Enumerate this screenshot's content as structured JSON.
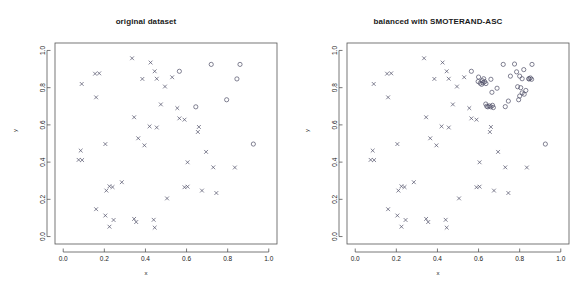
{
  "figure": {
    "background": "#ffffff",
    "axis_color": "#555555",
    "marker_color": "#4d4d66",
    "width": 584,
    "height": 292
  },
  "panels": [
    {
      "id": "original",
      "title": "original dataset",
      "xlabel": "x",
      "ylabel": "y"
    },
    {
      "id": "balanced",
      "title": "balanced with SMOTERAND-ASC",
      "xlabel": "x",
      "ylabel": "y"
    }
  ],
  "chart_data": [
    {
      "type": "scatter",
      "title": "original dataset",
      "xlabel": "x",
      "ylabel": "y",
      "xlim": [
        -0.04,
        1.04
      ],
      "ylim": [
        -0.04,
        1.04
      ],
      "xticks": [
        "0.0",
        "0.2",
        "0.4",
        "0.6",
        "0.8",
        "1.0"
      ],
      "yticks": [
        "0.0",
        "0.2",
        "0.4",
        "0.6",
        "0.8",
        "1.0"
      ],
      "xtick_values": [
        0.0,
        0.2,
        0.4,
        0.6,
        0.8,
        1.0
      ],
      "ytick_values": [
        0.0,
        0.2,
        0.4,
        0.6,
        0.8,
        1.0
      ],
      "grid": false,
      "legend": "none",
      "series": [
        {
          "name": "majority class",
          "marker": "x",
          "color": "#4d4d66",
          "points": [
            [
              0.09,
              0.82
            ],
            [
              0.155,
              0.875
            ],
            [
              0.175,
              0.877
            ],
            [
              0.16,
              0.748
            ],
            [
              0.085,
              0.462
            ],
            [
              0.075,
              0.412
            ],
            [
              0.092,
              0.411
            ],
            [
              0.205,
              0.497
            ],
            [
              0.335,
              0.958
            ],
            [
              0.385,
              0.847
            ],
            [
              0.425,
              0.935
            ],
            [
              0.445,
              0.888
            ],
            [
              0.455,
              0.848
            ],
            [
              0.495,
              0.806
            ],
            [
              0.53,
              0.856
            ],
            [
              0.345,
              0.641
            ],
            [
              0.475,
              0.71
            ],
            [
              0.555,
              0.69
            ],
            [
              0.42,
              0.592
            ],
            [
              0.455,
              0.586
            ],
            [
              0.365,
              0.528
            ],
            [
              0.395,
              0.49
            ],
            [
              0.565,
              0.635
            ],
            [
              0.59,
              0.628
            ],
            [
              0.66,
              0.589
            ],
            [
              0.655,
              0.562
            ],
            [
              0.695,
              0.455
            ],
            [
              0.73,
              0.372
            ],
            [
              0.835,
              0.371
            ],
            [
              0.605,
              0.399
            ],
            [
              0.225,
              0.27
            ],
            [
              0.24,
              0.266
            ],
            [
              0.21,
              0.247
            ],
            [
              0.285,
              0.292
            ],
            [
              0.505,
              0.205
            ],
            [
              0.59,
              0.265
            ],
            [
              0.605,
              0.268
            ],
            [
              0.675,
              0.247
            ],
            [
              0.745,
              0.234
            ],
            [
              0.16,
              0.147
            ],
            [
              0.205,
              0.113
            ],
            [
              0.245,
              0.089
            ],
            [
              0.225,
              0.053
            ],
            [
              0.345,
              0.095
            ],
            [
              0.355,
              0.078
            ],
            [
              0.44,
              0.09
            ],
            [
              0.445,
              0.048
            ]
          ]
        },
        {
          "name": "minority class",
          "marker": "o",
          "color": "#4d4d66",
          "points": [
            [
              0.565,
              0.888
            ],
            [
              0.72,
              0.925
            ],
            [
              0.86,
              0.925
            ],
            [
              0.845,
              0.847
            ],
            [
              0.795,
              0.735
            ],
            [
              0.645,
              0.697
            ],
            [
              0.925,
              0.497
            ]
          ]
        }
      ]
    },
    {
      "type": "scatter",
      "title": "balanced with SMOTERAND-ASC",
      "xlabel": "x",
      "ylabel": "y",
      "xlim": [
        -0.04,
        1.04
      ],
      "ylim": [
        -0.04,
        1.04
      ],
      "xticks": [
        "0.0",
        "0.2",
        "0.4",
        "0.6",
        "0.8",
        "1.0"
      ],
      "yticks": [
        "0.0",
        "0.2",
        "0.4",
        "0.6",
        "0.8",
        "1.0"
      ],
      "xtick_values": [
        0.0,
        0.2,
        0.4,
        0.6,
        0.8,
        1.0
      ],
      "ytick_values": [
        0.0,
        0.2,
        0.4,
        0.6,
        0.8,
        1.0
      ],
      "grid": false,
      "legend": "none",
      "series": [
        {
          "name": "majority class",
          "marker": "x",
          "color": "#4d4d66",
          "points": [
            [
              0.09,
              0.82
            ],
            [
              0.155,
              0.875
            ],
            [
              0.175,
              0.877
            ],
            [
              0.16,
              0.748
            ],
            [
              0.085,
              0.462
            ],
            [
              0.075,
              0.412
            ],
            [
              0.092,
              0.411
            ],
            [
              0.205,
              0.497
            ],
            [
              0.335,
              0.958
            ],
            [
              0.385,
              0.847
            ],
            [
              0.425,
              0.935
            ],
            [
              0.445,
              0.888
            ],
            [
              0.455,
              0.848
            ],
            [
              0.495,
              0.806
            ],
            [
              0.53,
              0.856
            ],
            [
              0.345,
              0.641
            ],
            [
              0.475,
              0.71
            ],
            [
              0.555,
              0.69
            ],
            [
              0.42,
              0.592
            ],
            [
              0.455,
              0.586
            ],
            [
              0.365,
              0.528
            ],
            [
              0.395,
              0.49
            ],
            [
              0.565,
              0.635
            ],
            [
              0.59,
              0.628
            ],
            [
              0.66,
              0.589
            ],
            [
              0.655,
              0.562
            ],
            [
              0.695,
              0.455
            ],
            [
              0.73,
              0.372
            ],
            [
              0.835,
              0.371
            ],
            [
              0.605,
              0.399
            ],
            [
              0.225,
              0.27
            ],
            [
              0.24,
              0.266
            ],
            [
              0.21,
              0.247
            ],
            [
              0.285,
              0.292
            ],
            [
              0.505,
              0.205
            ],
            [
              0.59,
              0.265
            ],
            [
              0.605,
              0.268
            ],
            [
              0.675,
              0.247
            ],
            [
              0.745,
              0.234
            ],
            [
              0.16,
              0.147
            ],
            [
              0.205,
              0.113
            ],
            [
              0.245,
              0.089
            ],
            [
              0.225,
              0.053
            ],
            [
              0.345,
              0.095
            ],
            [
              0.355,
              0.078
            ],
            [
              0.44,
              0.09
            ],
            [
              0.445,
              0.048
            ]
          ]
        },
        {
          "name": "minority class (original)",
          "marker": "o",
          "color": "#4d4d66",
          "points": [
            [
              0.565,
              0.888
            ],
            [
              0.72,
              0.925
            ],
            [
              0.86,
              0.925
            ],
            [
              0.845,
              0.847
            ],
            [
              0.795,
              0.735
            ],
            [
              0.645,
              0.697
            ],
            [
              0.925,
              0.497
            ]
          ]
        },
        {
          "name": "synthetic minority samples",
          "marker": "o",
          "color": "#4d4d66",
          "points": [
            [
              0.6,
              0.857
            ],
            [
              0.625,
              0.848
            ],
            [
              0.618,
              0.838
            ],
            [
              0.63,
              0.832
            ],
            [
              0.622,
              0.826
            ],
            [
              0.636,
              0.822
            ],
            [
              0.615,
              0.818
            ],
            [
              0.608,
              0.824
            ],
            [
              0.598,
              0.833
            ],
            [
              0.66,
              0.845
            ],
            [
              0.665,
              0.775
            ],
            [
              0.69,
              0.797
            ],
            [
              0.755,
              0.862
            ],
            [
              0.775,
              0.927
            ],
            [
              0.785,
              0.885
            ],
            [
              0.8,
              0.862
            ],
            [
              0.812,
              0.848
            ],
            [
              0.82,
              0.897
            ],
            [
              0.805,
              0.8
            ],
            [
              0.79,
              0.805
            ],
            [
              0.812,
              0.772
            ],
            [
              0.8,
              0.755
            ],
            [
              0.822,
              0.765
            ],
            [
              0.83,
              0.785
            ],
            [
              0.845,
              0.848
            ],
            [
              0.852,
              0.852
            ],
            [
              0.858,
              0.845
            ],
            [
              0.64,
              0.7
            ],
            [
              0.652,
              0.702
            ],
            [
              0.66,
              0.697
            ],
            [
              0.668,
              0.705
            ],
            [
              0.672,
              0.693
            ],
            [
              0.635,
              0.712
            ],
            [
              0.73,
              0.698
            ],
            [
              0.745,
              0.728
            ]
          ]
        }
      ]
    }
  ]
}
